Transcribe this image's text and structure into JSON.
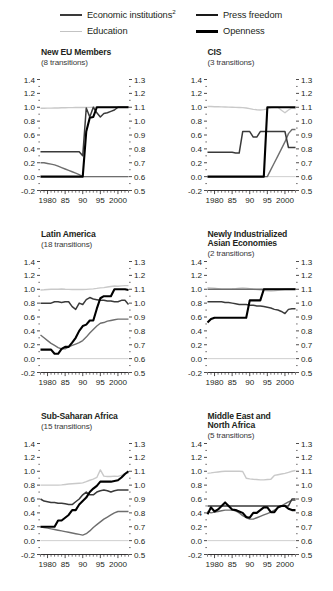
{
  "legend": {
    "items": [
      {
        "name": "economic-institutions",
        "label": "Economic institutions",
        "sup": "2",
        "style": "sw-econ"
      },
      {
        "name": "education",
        "label": "Education",
        "sup": "",
        "style": "sw-edu"
      },
      {
        "name": "press-freedom",
        "label": "Press freedom",
        "sup": "",
        "style": "sw-press"
      },
      {
        "name": "openness",
        "label": "Openness",
        "sup": "",
        "style": "sw-open"
      }
    ]
  },
  "axes": {
    "left_ticks": [
      "1.4",
      "1.2",
      "1.0",
      "0.8",
      "0.6",
      "0.4",
      "0.2",
      "0.0",
      "-0.2"
    ],
    "right_ticks": [
      "1.3",
      "1.2",
      "1.1",
      "1.0",
      "0.9",
      "0.8",
      "0.7",
      "0.6",
      "0.5"
    ],
    "x_ticks": [
      "1980",
      "85",
      "90",
      "95",
      "2000"
    ]
  },
  "colors": {
    "economic_institutions": "#3a3a3a",
    "education": "#c9c9c9",
    "press_freedom": "#6e6e6e",
    "openness": "#000000",
    "axis": "#231f20",
    "zero_line": "#cfcfcf",
    "background": "#ffffff"
  },
  "chart_data": {
    "type": "line",
    "title": "",
    "xlabel": "",
    "ylabel": "",
    "grid": false,
    "legend_position": "top",
    "xlim": [
      1978,
      2003
    ],
    "left_ylim": [
      -0.2,
      1.4
    ],
    "right_ylim": [
      0.5,
      1.3
    ],
    "left_series": [
      "Economic institutions",
      "Press freedom",
      "Openness"
    ],
    "right_series": [
      "Education"
    ],
    "x": [
      1978,
      1979,
      1980,
      1981,
      1982,
      1983,
      1984,
      1985,
      1986,
      1987,
      1988,
      1989,
      1990,
      1991,
      1992,
      1993,
      1994,
      1995,
      1996,
      1997,
      1998,
      1999,
      2000,
      2001,
      2002,
      2003
    ],
    "panels": [
      {
        "name": "new-eu-members",
        "title": "New EU Members",
        "subtitle": "(8 transitions)",
        "transitions": 8,
        "series": [
          {
            "name": "Economic institutions",
            "axis": "left",
            "values": [
              0.36,
              0.36,
              0.36,
              0.36,
              0.36,
              0.36,
              0.36,
              0.36,
              0.36,
              0.36,
              0.36,
              0.36,
              0.3,
              0.99,
              0.86,
              1.0,
              0.92,
              0.86,
              0.91,
              0.92,
              0.94,
              0.96,
              1.0,
              1.0,
              1.0,
              1.0
            ]
          },
          {
            "name": "Press freedom",
            "axis": "left",
            "values": [
              0.2,
              0.2,
              0.19,
              0.18,
              0.17,
              0.15,
              0.13,
              0.11,
              0.09,
              0.07,
              0.05,
              0.03,
              0.0,
              0.0,
              0.0,
              0.0,
              0.0,
              0.0,
              0.0,
              0.0,
              0.0,
              0.0,
              0.0,
              0.0,
              0.0,
              0.0
            ]
          },
          {
            "name": "Openness",
            "axis": "left",
            "values": [
              0.0,
              0.0,
              0.0,
              0.0,
              0.0,
              0.0,
              0.0,
              0.0,
              0.0,
              0.0,
              0.0,
              0.0,
              0.0,
              0.65,
              0.85,
              0.86,
              1.0,
              1.0,
              1.0,
              1.0,
              1.0,
              1.0,
              1.0,
              1.0,
              1.0,
              1.0
            ]
          },
          {
            "name": "Education",
            "axis": "right",
            "values": [
              1.093,
              1.093,
              1.094,
              1.094,
              1.095,
              1.095,
              1.096,
              1.096,
              1.097,
              1.097,
              1.098,
              1.098,
              1.098,
              1.099,
              1.099,
              1.1,
              1.1,
              1.1,
              1.101,
              1.101,
              1.101,
              1.102,
              1.102,
              1.102,
              1.102,
              1.102
            ]
          }
        ]
      },
      {
        "name": "cis",
        "title": "CIS",
        "subtitle": "(3 transitions)",
        "transitions": 3,
        "series": [
          {
            "name": "Economic institutions",
            "axis": "left",
            "values": [
              0.35,
              0.35,
              0.35,
              0.35,
              0.35,
              0.35,
              0.35,
              0.35,
              0.34,
              0.34,
              0.65,
              0.65,
              0.65,
              0.57,
              0.57,
              0.65,
              0.65,
              0.65,
              0.65,
              0.65,
              0.65,
              0.65,
              0.65,
              0.42,
              0.42,
              0.42
            ]
          },
          {
            "name": "Press freedom",
            "axis": "left",
            "values": [
              0.0,
              0.0,
              0.0,
              0.0,
              0.0,
              0.0,
              0.0,
              0.0,
              0.0,
              0.0,
              0.0,
              0.0,
              0.0,
              0.0,
              0.0,
              0.0,
              0.0,
              0.0,
              0.1,
              0.2,
              0.3,
              0.4,
              0.5,
              0.62,
              0.68,
              0.68
            ]
          },
          {
            "name": "Openness",
            "axis": "left",
            "values": [
              0.0,
              0.0,
              0.0,
              0.0,
              0.0,
              0.0,
              0.0,
              0.0,
              0.0,
              0.0,
              0.0,
              0.0,
              0.0,
              0.0,
              0.0,
              0.0,
              0.0,
              1.0,
              1.0,
              1.0,
              1.0,
              1.0,
              1.0,
              1.0,
              1.0,
              1.0
            ]
          },
          {
            "name": "Education",
            "axis": "right",
            "values": [
              1.105,
              1.105,
              1.104,
              1.104,
              1.103,
              1.102,
              1.101,
              1.1,
              1.099,
              1.098,
              1.097,
              1.095,
              1.09,
              1.085,
              1.082,
              1.08,
              1.083,
              1.088,
              1.098,
              1.1,
              1.1,
              1.078,
              1.06,
              1.08,
              1.095,
              1.09
            ]
          }
        ]
      },
      {
        "name": "latin-america",
        "title": "Latin America",
        "subtitle": "(18 transitions)",
        "transitions": 18,
        "series": [
          {
            "name": "Economic institutions",
            "axis": "left",
            "values": [
              0.8,
              0.8,
              0.8,
              0.8,
              0.82,
              0.82,
              0.81,
              0.82,
              0.82,
              0.75,
              0.71,
              0.8,
              0.78,
              0.85,
              0.88,
              0.86,
              0.85,
              0.84,
              0.84,
              0.83,
              0.83,
              0.82,
              0.82,
              0.84,
              0.84,
              0.78
            ]
          },
          {
            "name": "Press freedom",
            "axis": "left",
            "values": [
              0.34,
              0.3,
              0.26,
              0.22,
              0.19,
              0.16,
              0.14,
              0.14,
              0.17,
              0.19,
              0.21,
              0.23,
              0.26,
              0.31,
              0.37,
              0.42,
              0.47,
              0.51,
              0.52,
              0.54,
              0.55,
              0.56,
              0.57,
              0.57,
              0.57,
              0.57
            ]
          },
          {
            "name": "Openness",
            "axis": "left",
            "values": [
              0.13,
              0.13,
              0.13,
              0.13,
              0.07,
              0.07,
              0.14,
              0.17,
              0.17,
              0.23,
              0.3,
              0.4,
              0.47,
              0.49,
              0.55,
              0.55,
              0.72,
              0.87,
              0.9,
              0.9,
              0.9,
              1.0,
              1.0,
              1.0,
              1.0,
              0.99
            ]
          },
          {
            "name": "Education",
            "axis": "right",
            "values": [
              1.095,
              1.096,
              1.098,
              1.1,
              1.101,
              1.1,
              1.102,
              1.1,
              1.099,
              1.098,
              1.098,
              1.099,
              1.098,
              1.099,
              1.101,
              1.103,
              1.106,
              1.11,
              1.112,
              1.116,
              1.12,
              1.123,
              1.122,
              1.124,
              1.126,
              1.126
            ]
          }
        ]
      },
      {
        "name": "newly-industrialized-asian-economies",
        "title": "Newly Industrialized\nAsian Economies",
        "subtitle": "(2 transitions)",
        "transitions": 2,
        "series": [
          {
            "name": "Economic institutions",
            "axis": "left",
            "values": [
              0.82,
              0.82,
              0.82,
              0.82,
              0.82,
              0.81,
              0.81,
              0.8,
              0.79,
              0.78,
              0.78,
              0.78,
              0.77,
              0.77,
              0.76,
              0.76,
              0.75,
              0.74,
              0.73,
              0.71,
              0.7,
              0.68,
              0.65,
              0.71,
              0.72,
              0.72
            ]
          },
          {
            "name": "Press freedom",
            "axis": "left",
            "values": [
              1.0,
              1.0,
              1.0,
              1.0,
              1.0,
              1.0,
              1.0,
              1.0,
              1.0,
              1.0,
              1.0,
              1.0,
              1.0,
              1.0,
              1.0,
              1.0,
              1.0,
              1.0,
              1.0,
              1.0,
              1.0,
              1.0,
              1.0,
              1.0,
              1.0,
              1.0
            ]
          },
          {
            "name": "Openness",
            "axis": "left",
            "values": [
              0.52,
              0.57,
              0.59,
              0.59,
              0.59,
              0.59,
              0.59,
              0.59,
              0.59,
              0.59,
              0.59,
              0.59,
              0.84,
              0.84,
              0.84,
              0.84,
              1.0,
              1.0,
              1.0,
              1.0,
              1.0,
              1.0,
              1.0,
              1.0,
              1.0,
              1.0
            ]
          },
          {
            "name": "Education",
            "axis": "right",
            "values": [
              1.112,
              1.11,
              1.107,
              1.104,
              1.101,
              1.1,
              1.101,
              1.102,
              1.104,
              1.107,
              1.11,
              1.108,
              1.104,
              1.1,
              1.097,
              1.094,
              1.091,
              1.089,
              1.087,
              1.089,
              1.092,
              1.096,
              1.1,
              1.102,
              1.103,
              1.103
            ]
          }
        ]
      },
      {
        "name": "sub-saharan-africa",
        "title": "Sub-Saharan Africa",
        "subtitle": "(15 transitions)",
        "transitions": 15,
        "series": [
          {
            "name": "Economic institutions",
            "axis": "left",
            "values": [
              0.6,
              0.57,
              0.56,
              0.55,
              0.55,
              0.54,
              0.54,
              0.53,
              0.52,
              0.52,
              0.56,
              0.6,
              0.66,
              0.7,
              0.66,
              0.66,
              0.7,
              0.72,
              0.73,
              0.72,
              0.7,
              0.72,
              0.73,
              0.73,
              0.73,
              0.73
            ]
          },
          {
            "name": "Press freedom",
            "axis": "left",
            "values": [
              0.2,
              0.19,
              0.18,
              0.17,
              0.16,
              0.15,
              0.14,
              0.13,
              0.12,
              0.11,
              0.1,
              0.09,
              0.08,
              0.1,
              0.14,
              0.19,
              0.23,
              0.27,
              0.31,
              0.34,
              0.37,
              0.4,
              0.42,
              0.42,
              0.42,
              0.42
            ]
          },
          {
            "name": "Openness",
            "axis": "left",
            "values": [
              0.2,
              0.2,
              0.2,
              0.2,
              0.2,
              0.29,
              0.29,
              0.33,
              0.37,
              0.44,
              0.44,
              0.52,
              0.57,
              0.62,
              0.7,
              0.75,
              0.79,
              0.85,
              0.85,
              0.85,
              0.85,
              0.86,
              0.87,
              0.91,
              0.96,
              1.0
            ]
          },
          {
            "name": "Education",
            "axis": "right",
            "values": [
              1.0,
              1.0,
              1.0,
              1.0,
              1.0,
              1.0,
              1.002,
              1.005,
              1.008,
              1.01,
              1.012,
              1.014,
              1.016,
              1.025,
              1.035,
              1.043,
              1.055,
              1.11,
              1.065,
              1.062,
              1.062,
              1.065,
              1.063,
              1.07,
              1.085,
              1.085
            ]
          }
        ]
      },
      {
        "name": "middle-east-and-north-africa",
        "title": "Middle East and\nNorth Africa",
        "subtitle": "(5 transitions)",
        "transitions": 5,
        "series": [
          {
            "name": "Economic institutions",
            "axis": "left",
            "values": [
              0.5,
              0.5,
              0.5,
              0.5,
              0.5,
              0.5,
              0.5,
              0.5,
              0.5,
              0.5,
              0.5,
              0.5,
              0.5,
              0.5,
              0.5,
              0.5,
              0.5,
              0.5,
              0.5,
              0.5,
              0.5,
              0.5,
              0.5,
              0.5,
              0.6,
              0.6
            ]
          },
          {
            "name": "Press freedom",
            "axis": "left",
            "values": [
              0.42,
              0.4,
              0.41,
              0.42,
              0.43,
              0.44,
              0.44,
              0.44,
              0.43,
              0.4,
              0.36,
              0.33,
              0.31,
              0.31,
              0.33,
              0.35,
              0.37,
              0.39,
              0.41,
              0.44,
              0.47,
              0.5,
              0.53,
              0.56,
              0.58,
              0.58
            ]
          },
          {
            "name": "Openness",
            "axis": "left",
            "values": [
              0.38,
              0.48,
              0.42,
              0.45,
              0.5,
              0.55,
              0.5,
              0.45,
              0.44,
              0.42,
              0.4,
              0.34,
              0.33,
              0.4,
              0.4,
              0.44,
              0.48,
              0.48,
              0.41,
              0.41,
              0.48,
              0.5,
              0.5,
              0.46,
              0.44,
              0.44
            ]
          },
          {
            "name": "Education",
            "axis": "right",
            "values": [
              1.085,
              1.088,
              1.092,
              1.095,
              1.098,
              1.1,
              1.1,
              1.1,
              1.1,
              1.1,
              1.098,
              1.05,
              1.045,
              1.042,
              1.04,
              1.038,
              1.038,
              1.04,
              1.042,
              1.07,
              1.075,
              1.08,
              1.085,
              1.092,
              1.1,
              1.105
            ]
          }
        ]
      }
    ]
  }
}
